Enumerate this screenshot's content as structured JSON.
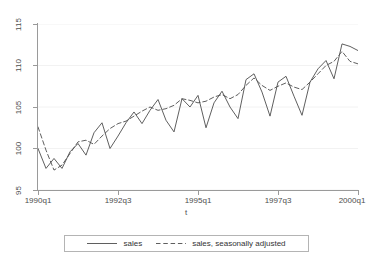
{
  "chart_data": {
    "type": "line",
    "title": "",
    "subtitle": "",
    "xlabel": "t",
    "ylabel": "",
    "grid": true,
    "grid_axis": "y",
    "legend_position": "bottom",
    "xlim": [
      1990.0,
      2000.0
    ],
    "ylim": [
      95,
      115
    ],
    "yticks": [
      95,
      100,
      105,
      110,
      115
    ],
    "ytick_labels": [
      "95",
      "100",
      "105",
      "110",
      "115"
    ],
    "xticks": [
      1990.0,
      1992.5,
      1995.0,
      1997.5,
      2000.0
    ],
    "xtick_labels": [
      "1990q1",
      "1992q3",
      "1995q1",
      "1997q3",
      "2000q1"
    ],
    "x": [
      "1990q1",
      "1990q2",
      "1990q3",
      "1990q4",
      "1991q1",
      "1991q2",
      "1991q3",
      "1991q4",
      "1992q1",
      "1992q2",
      "1992q3",
      "1992q4",
      "1993q1",
      "1993q2",
      "1993q3",
      "1993q4",
      "1994q1",
      "1994q2",
      "1994q3",
      "1994q4",
      "1995q1",
      "1995q2",
      "1995q3",
      "1995q4",
      "1996q1",
      "1996q2",
      "1996q3",
      "1996q4",
      "1997q1",
      "1997q2",
      "1997q3",
      "1997q4",
      "1998q1",
      "1998q2",
      "1998q3",
      "1998q4",
      "1999q1",
      "1999q2",
      "1999q3",
      "1999q4",
      "2000q1"
    ],
    "series": [
      {
        "name": "sales",
        "style": "solid",
        "color": "#4d4d4d",
        "values": [
          100.0,
          97.6,
          98.8,
          97.6,
          99.6,
          100.6,
          99.2,
          101.9,
          103.1,
          100.0,
          101.5,
          103.1,
          104.4,
          103.0,
          104.6,
          105.9,
          103.4,
          102.0,
          106.0,
          105.0,
          106.4,
          102.5,
          105.5,
          106.9,
          105.0,
          103.6,
          108.3,
          109.0,
          106.8,
          103.9,
          108.0,
          108.7,
          106.3,
          104.0,
          108.0,
          109.6,
          110.6,
          108.4,
          112.6,
          112.3,
          111.8
        ]
      },
      {
        "name": "sales, seasonally adjusted",
        "style": "dashed",
        "color": "#4d4d4d",
        "values": [
          102.6,
          99.8,
          97.4,
          98.0,
          99.4,
          100.8,
          101.0,
          100.5,
          101.5,
          102.4,
          103.0,
          103.3,
          103.9,
          104.5,
          105.0,
          104.6,
          104.8,
          105.2,
          106.0,
          105.8,
          105.5,
          105.7,
          106.2,
          106.5,
          106.0,
          106.5,
          107.6,
          108.5,
          107.6,
          107.0,
          107.5,
          107.9,
          107.4,
          107.1,
          108.0,
          109.0,
          110.0,
          110.5,
          111.7,
          110.5,
          110.2
        ]
      }
    ]
  },
  "axes": {
    "y_tick_labels": [
      "115",
      "110",
      "105",
      "100",
      "95"
    ],
    "x_tick_labels": [
      "1990q1",
      "1992q3",
      "1995q1",
      "1997q3",
      "2000q1"
    ],
    "x_title": "t"
  },
  "legend": {
    "entries": [
      {
        "label": "sales",
        "style": "solid"
      },
      {
        "label": "sales, seasonally adjusted",
        "style": "dashed"
      }
    ]
  },
  "colors": {
    "line": "#4d4d4d",
    "axis": "#9a9a9a",
    "grid": "#f2f2f2",
    "background": "#ffffff",
    "legend_border": "#b4b4b4"
  }
}
